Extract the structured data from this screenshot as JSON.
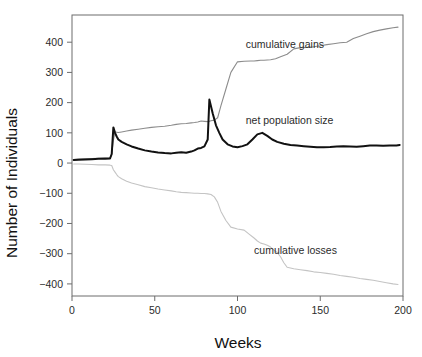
{
  "chart_data": {
    "type": "line",
    "title": "",
    "xlabel": "Weeks",
    "ylabel": "Number of Individuals",
    "xlim": [
      0,
      200
    ],
    "ylim": [
      -440,
      490
    ],
    "grid": false,
    "legend_position": "inline-annotations",
    "xticks": [
      0,
      50,
      100,
      150,
      200
    ],
    "xtick_labels": [
      "0",
      "50",
      "100",
      "150",
      "200"
    ],
    "yticks": [
      -400,
      -300,
      -200,
      -100,
      0,
      100,
      200,
      300,
      400
    ],
    "ytick_labels": [
      "−400",
      "−300",
      "−200",
      "−100",
      "0",
      "100",
      "200",
      "300",
      "400"
    ],
    "annotations": [
      {
        "text": "cumulative gains",
        "x": 105,
        "y": 380
      },
      {
        "text": "net population size",
        "x": 105,
        "y": 130
      },
      {
        "text": "cumulative losses",
        "x": 110,
        "y": -300
      }
    ],
    "series": [
      {
        "name": "cumulative gains",
        "color": "#8c8c8c",
        "width": 1.1,
        "x": [
          1,
          4,
          8,
          12,
          16,
          20,
          23,
          24,
          25,
          26,
          27,
          28,
          30,
          33,
          36,
          40,
          44,
          48,
          52,
          56,
          60,
          63,
          66,
          69,
          72,
          74,
          76,
          78,
          80,
          82,
          84,
          86,
          88,
          90,
          93,
          96,
          100,
          104,
          108,
          110,
          112,
          114,
          116,
          118,
          120,
          123,
          126,
          130,
          134,
          138,
          142,
          146,
          150,
          154,
          158,
          162,
          166,
          170,
          174,
          178,
          182,
          186,
          190,
          194,
          197
        ],
        "y": [
          12,
          13,
          14,
          15,
          16,
          17,
          18,
          30,
          75,
          103,
          102,
          101,
          103,
          106,
          109,
          112,
          115,
          118,
          120,
          122,
          125,
          128,
          130,
          131,
          133,
          134,
          136,
          139,
          138,
          137,
          140,
          142,
          150,
          190,
          245,
          300,
          335,
          337,
          338,
          338,
          339,
          340,
          340,
          341,
          342,
          345,
          352,
          360,
          378,
          382,
          383,
          385,
          388,
          392,
          395,
          398,
          400,
          412,
          420,
          428,
          435,
          440,
          444,
          448,
          450
        ]
      },
      {
        "name": "net population size",
        "color": "#111111",
        "width": 2.0,
        "x": [
          1,
          4,
          8,
          12,
          16,
          20,
          23,
          24,
          25,
          26,
          27,
          28,
          30,
          33,
          36,
          40,
          44,
          48,
          52,
          56,
          60,
          63,
          66,
          69,
          72,
          74,
          76,
          78,
          80,
          82,
          83,
          85,
          87,
          89,
          91,
          94,
          97,
          100,
          103,
          106,
          109,
          112,
          115,
          118,
          121,
          124,
          128,
          132,
          136,
          140,
          144,
          148,
          152,
          156,
          160,
          164,
          168,
          172,
          176,
          180,
          184,
          188,
          192,
          196,
          198
        ],
        "y": [
          10,
          11,
          12,
          13,
          14,
          14,
          15,
          30,
          118,
          100,
          88,
          78,
          70,
          62,
          55,
          48,
          42,
          38,
          35,
          33,
          32,
          34,
          36,
          34,
          38,
          42,
          48,
          50,
          55,
          78,
          210,
          165,
          125,
          100,
          78,
          62,
          55,
          52,
          56,
          62,
          78,
          95,
          100,
          90,
          78,
          70,
          64,
          60,
          58,
          56,
          54,
          52,
          52,
          53,
          55,
          56,
          55,
          54,
          56,
          58,
          58,
          57,
          58,
          58,
          60
        ]
      },
      {
        "name": "cumulative losses",
        "color": "#c4c4c4",
        "width": 1.1,
        "x": [
          1,
          4,
          8,
          12,
          16,
          20,
          23,
          24,
          25,
          26,
          27,
          28,
          30,
          33,
          36,
          40,
          44,
          48,
          52,
          56,
          60,
          63,
          66,
          69,
          72,
          74,
          76,
          78,
          80,
          82,
          84,
          86,
          88,
          90,
          93,
          96,
          100,
          104,
          107,
          110,
          112,
          114,
          116,
          118,
          120,
          122,
          124,
          126,
          128,
          130,
          134,
          138,
          142,
          146,
          150,
          154,
          158,
          162,
          166,
          170,
          174,
          178,
          182,
          186,
          190,
          194,
          197
        ],
        "y": [
          -3,
          -3,
          -4,
          -5,
          -6,
          -6,
          -7,
          -8,
          -22,
          -30,
          -38,
          -45,
          -52,
          -60,
          -66,
          -72,
          -78,
          -82,
          -86,
          -89,
          -92,
          -95,
          -97,
          -98,
          -99,
          -100,
          -100,
          -101,
          -101,
          -102,
          -104,
          -112,
          -130,
          -160,
          -190,
          -212,
          -218,
          -222,
          -235,
          -248,
          -258,
          -265,
          -268,
          -272,
          -278,
          -288,
          -296,
          -310,
          -330,
          -345,
          -350,
          -353,
          -356,
          -360,
          -362,
          -365,
          -368,
          -372,
          -375,
          -378,
          -382,
          -385,
          -388,
          -392,
          -396,
          -400,
          -402
        ]
      }
    ]
  },
  "axes": {
    "x_title": "Weeks",
    "y_title": "Number of Individuals"
  }
}
